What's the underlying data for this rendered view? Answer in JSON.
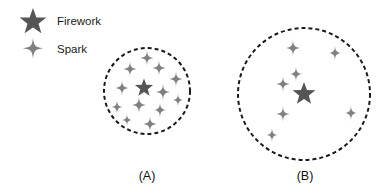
{
  "figure": {
    "width": 390,
    "height": 196,
    "background": "#ffffff"
  },
  "colors": {
    "firework": "#555555",
    "spark": "#808080",
    "outline": "#1a1a1a",
    "text": "#111111"
  },
  "legend": {
    "items": [
      {
        "icon": "star-icon",
        "label": "Firework",
        "color": "#555555"
      },
      {
        "icon": "sparkle-icon",
        "label": "Spark",
        "color": "#808080"
      }
    ],
    "firework_label": "Firework",
    "spark_label": "Spark"
  },
  "panels": [
    {
      "id": "A",
      "caption": "(A)",
      "caption_x": 147,
      "caption_y": 180,
      "circle": {
        "cx": 147,
        "cy": 91,
        "r": 43,
        "dash": "4 3",
        "stroke_width": 2
      },
      "firework": {
        "x": 144,
        "y": 88,
        "size": 9.5
      },
      "sparks": [
        {
          "x": 147,
          "y": 58,
          "size": 9
        },
        {
          "x": 130,
          "y": 69,
          "size": 9
        },
        {
          "x": 159,
          "y": 68,
          "size": 9
        },
        {
          "x": 176,
          "y": 79,
          "size": 9
        },
        {
          "x": 122,
          "y": 88,
          "size": 9
        },
        {
          "x": 163,
          "y": 92,
          "size": 9.5
        },
        {
          "x": 139,
          "y": 105,
          "size": 9.5
        },
        {
          "x": 160,
          "y": 110,
          "size": 8.5
        },
        {
          "x": 117,
          "y": 107,
          "size": 8
        },
        {
          "x": 150,
          "y": 124,
          "size": 9
        },
        {
          "x": 178,
          "y": 100,
          "size": 7.5
        },
        {
          "x": 127,
          "y": 120,
          "size": 7
        }
      ]
    },
    {
      "id": "B",
      "caption": "(B)",
      "caption_x": 305,
      "caption_y": 180,
      "circle": {
        "cx": 304,
        "cy": 94,
        "r": 66,
        "dash": "4 3",
        "stroke_width": 2
      },
      "firework": {
        "x": 304,
        "y": 94,
        "size": 12
      },
      "sparks": [
        {
          "x": 293,
          "y": 48,
          "size": 9.5
        },
        {
          "x": 335,
          "y": 53,
          "size": 8.5
        },
        {
          "x": 296,
          "y": 74,
          "size": 8.5
        },
        {
          "x": 283,
          "y": 84,
          "size": 9
        },
        {
          "x": 283,
          "y": 114,
          "size": 9
        },
        {
          "x": 351,
          "y": 113,
          "size": 8.5
        },
        {
          "x": 272,
          "y": 135,
          "size": 8
        }
      ]
    }
  ]
}
